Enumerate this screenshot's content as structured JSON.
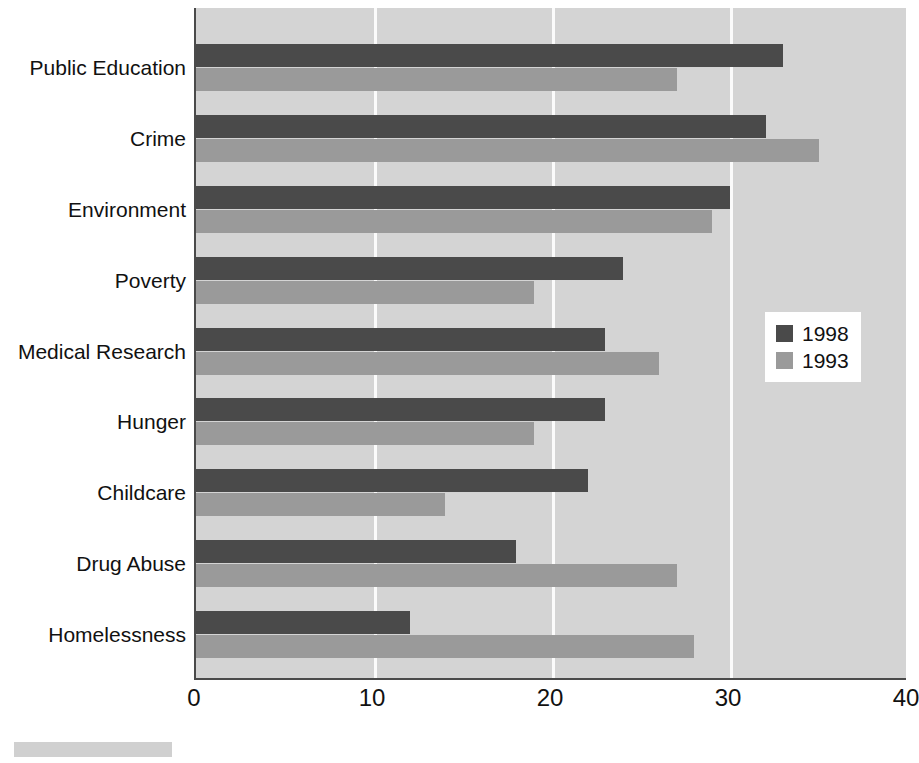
{
  "chart_data": {
    "type": "bar",
    "orientation": "horizontal",
    "title": "",
    "xlabel": "",
    "ylabel": "",
    "xlim": [
      0,
      40
    ],
    "xticks": [
      "0",
      "10",
      "20",
      "30",
      "40"
    ],
    "grid": true,
    "legend_position": "middle-right",
    "categories": [
      "Public Education",
      "Crime",
      "Environment",
      "Poverty",
      "Medical Research",
      "Hunger",
      "Childcare",
      "Drug Abuse",
      "Homelessness"
    ],
    "series": [
      {
        "name": "1998",
        "color": "#4a4a4a",
        "values": [
          33,
          32,
          30,
          24,
          23,
          23,
          22,
          18,
          12
        ]
      },
      {
        "name": "1993",
        "color": "#9a9a9a",
        "values": [
          27,
          35,
          29,
          19,
          26,
          19,
          14,
          27,
          28
        ]
      }
    ]
  },
  "legend": {
    "entries": [
      {
        "label": "1998"
      },
      {
        "label": "1993"
      }
    ]
  },
  "colors": {
    "series_1998": "#4a4a4a",
    "series_1993": "#9a9a9a",
    "plot_background": "#d4d4d4",
    "gridline": "#fbfbfb",
    "axis": "#4a4a4a",
    "page_background": "#ffffff",
    "text": "#111111"
  }
}
